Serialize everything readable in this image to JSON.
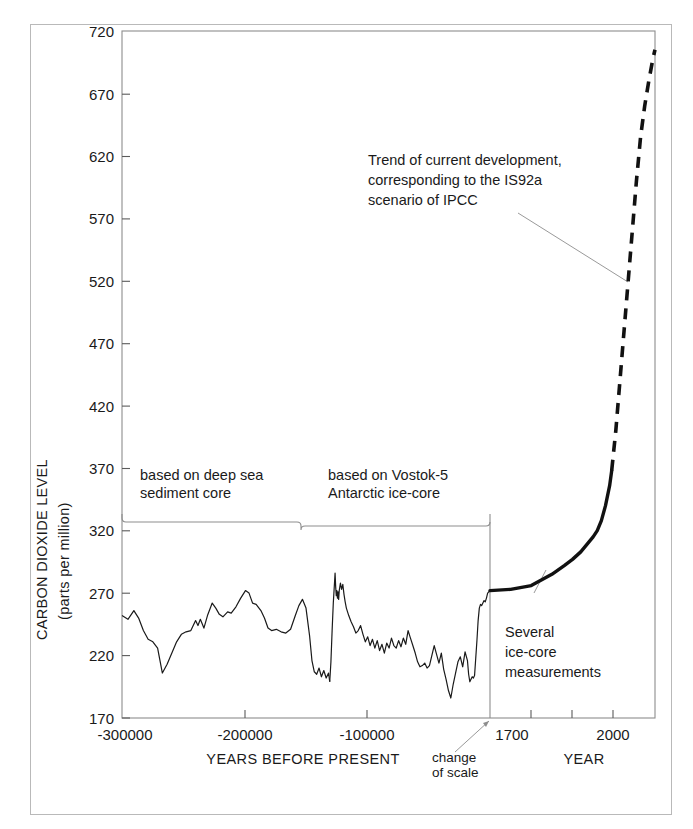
{
  "chart_data": {
    "type": "line",
    "title": "",
    "xlabel": "YEARS BEFORE PRESENT / YEAR",
    "ylabel": "CARBON DIOXIDE LEVEL (parts per million)",
    "ylim": [
      170,
      720
    ],
    "ytick_labels": [
      "170",
      "220",
      "270",
      "320",
      "370",
      "420",
      "470",
      "520",
      "570",
      "620",
      "670",
      "720"
    ],
    "yticks": [
      170,
      220,
      270,
      320,
      370,
      420,
      470,
      520,
      570,
      620,
      670,
      720
    ],
    "grid": false,
    "legend": "none",
    "axes": {
      "left": {
        "name": "YEARS BEFORE PRESENT",
        "label": "YEARS BEFORE PRESENT",
        "tick_labels": [
          "-300000",
          "-200000",
          "-100000"
        ],
        "ticks": [
          -300000,
          -200000,
          -100000
        ],
        "range": [
          -310000,
          0
        ]
      },
      "right": {
        "name": "YEAR",
        "label": "YEAR",
        "tick_labels": [
          "1700",
          "2000"
        ],
        "ticks": [
          1700,
          1800,
          1900,
          2000,
          2100
        ],
        "range": [
          1700,
          2100
        ]
      },
      "scale_break": {
        "label_line1": "change",
        "label_line2": "of scale",
        "at_year": 1700
      }
    },
    "annotations": [
      {
        "id": "deep-sea",
        "text_line1": "based on deep sea",
        "text_line2": "sediment core"
      },
      {
        "id": "vostok",
        "text_line1": "based on Vostok-5",
        "text_line2": "Antarctic ice-core"
      },
      {
        "id": "ipcc",
        "text_line1": "Trend of current development,",
        "text_line2": "corresponding to the IS92a",
        "text_line3": "scenario of IPCC"
      },
      {
        "id": "ice-core-meas",
        "text_line1": "Several",
        "text_line2": "ice-core",
        "text_line3": "measurements"
      }
    ],
    "series": [
      {
        "name": "deep sea sediment core",
        "style": "solid-thin",
        "x_units": "years before present",
        "points": [
          [
            -310000,
            252
          ],
          [
            -305000,
            249
          ],
          [
            -300000,
            256
          ],
          [
            -296000,
            250
          ],
          [
            -292000,
            240
          ],
          [
            -288000,
            233
          ],
          [
            -284000,
            231
          ],
          [
            -280000,
            226
          ],
          [
            -276000,
            206
          ],
          [
            -272000,
            213
          ],
          [
            -268000,
            222
          ],
          [
            -264000,
            231
          ],
          [
            -260000,
            237
          ],
          [
            -256000,
            239
          ],
          [
            -252000,
            240
          ],
          [
            -248000,
            248
          ],
          [
            -246000,
            244
          ],
          [
            -244000,
            249
          ],
          [
            -241000,
            242
          ],
          [
            -238000,
            252
          ],
          [
            -234000,
            262
          ],
          [
            -231000,
            258
          ],
          [
            -228000,
            253
          ],
          [
            -225000,
            251
          ],
          [
            -221000,
            255
          ],
          [
            -218000,
            254
          ],
          [
            -214000,
            259
          ],
          [
            -210000,
            266
          ],
          [
            -206000,
            272
          ],
          [
            -203000,
            270
          ],
          [
            -200000,
            262
          ],
          [
            -197000,
            261
          ],
          [
            -193000,
            256
          ],
          [
            -190000,
            250
          ],
          [
            -187000,
            242
          ],
          [
            -184000,
            240
          ],
          [
            -180000,
            241
          ],
          [
            -176000,
            239
          ],
          [
            -172000,
            238
          ],
          [
            -168000,
            241
          ],
          [
            -164000,
            252
          ],
          [
            -161000,
            260
          ],
          [
            -158000,
            265
          ],
          [
            -155000,
            258
          ],
          [
            -152000,
            236
          ],
          [
            -150000,
            216
          ],
          [
            -148000,
            207
          ],
          [
            -146000,
            205
          ],
          [
            -144000,
            210
          ],
          [
            -142000,
            203
          ],
          [
            -140000,
            208
          ],
          [
            -138000,
            202
          ],
          [
            -136000,
            206
          ],
          [
            -135000,
            199
          ]
        ]
      },
      {
        "name": "Vostok-5 Antarctic ice-core",
        "style": "solid-thin",
        "x_units": "years before present",
        "points": [
          [
            -135000,
            199
          ],
          [
            -134000,
            215
          ],
          [
            -133000,
            240
          ],
          [
            -132000,
            262
          ],
          [
            -131000,
            278
          ],
          [
            -130500,
            286
          ],
          [
            -130000,
            275
          ],
          [
            -129500,
            268
          ],
          [
            -129000,
            272
          ],
          [
            -128500,
            266
          ],
          [
            -128000,
            271
          ],
          [
            -127500,
            265
          ],
          [
            -127000,
            272
          ],
          [
            -126000,
            278
          ],
          [
            -125000,
            273
          ],
          [
            -124000,
            277
          ],
          [
            -123000,
            269
          ],
          [
            -122000,
            263
          ],
          [
            -121000,
            258
          ],
          [
            -119000,
            252
          ],
          [
            -117000,
            247
          ],
          [
            -115000,
            243
          ],
          [
            -113000,
            238
          ],
          [
            -111000,
            240
          ],
          [
            -109000,
            244
          ],
          [
            -107000,
            237
          ],
          [
            -105000,
            231
          ],
          [
            -103000,
            235
          ],
          [
            -101000,
            228
          ],
          [
            -99000,
            233
          ],
          [
            -97000,
            226
          ],
          [
            -95000,
            232
          ],
          [
            -93000,
            224
          ],
          [
            -91000,
            229
          ],
          [
            -89000,
            222
          ],
          [
            -87000,
            230
          ],
          [
            -85000,
            226
          ],
          [
            -83000,
            234
          ],
          [
            -81000,
            228
          ],
          [
            -79000,
            226
          ],
          [
            -77000,
            232
          ],
          [
            -75000,
            227
          ],
          [
            -73000,
            234
          ],
          [
            -71000,
            229
          ],
          [
            -69000,
            240
          ],
          [
            -67000,
            234
          ],
          [
            -65000,
            228
          ],
          [
            -63000,
            222
          ],
          [
            -61000,
            215
          ],
          [
            -59000,
            211
          ],
          [
            -57000,
            212
          ],
          [
            -55000,
            214
          ],
          [
            -53000,
            210
          ],
          [
            -51000,
            212
          ],
          [
            -49000,
            220
          ],
          [
            -47000,
            228
          ],
          [
            -45000,
            221
          ],
          [
            -43000,
            214
          ],
          [
            -41000,
            222
          ],
          [
            -39000,
            209
          ],
          [
            -37000,
            201
          ],
          [
            -35000,
            192
          ],
          [
            -33000,
            186
          ],
          [
            -31000,
            197
          ],
          [
            -29000,
            206
          ],
          [
            -27000,
            215
          ],
          [
            -25000,
            219
          ],
          [
            -23000,
            211
          ],
          [
            -21000,
            223
          ],
          [
            -19000,
            216
          ],
          [
            -18000,
            205
          ],
          [
            -17000,
            199
          ],
          [
            -16000,
            201
          ],
          [
            -15000,
            203
          ],
          [
            -14000,
            202
          ],
          [
            -13000,
            204
          ],
          [
            -12000,
            218
          ],
          [
            -11000,
            232
          ],
          [
            -10000,
            248
          ],
          [
            -9000,
            258
          ],
          [
            -8000,
            261
          ],
          [
            -7000,
            260
          ],
          [
            -6000,
            262
          ],
          [
            -5000,
            264
          ],
          [
            -4000,
            263
          ],
          [
            -3000,
            266
          ],
          [
            -2000,
            270
          ],
          [
            -1000,
            271
          ],
          [
            0,
            272
          ]
        ]
      },
      {
        "name": "Several ice-core measurements / instrumental record",
        "style": "solid-thick",
        "x_units": "year",
        "points": [
          [
            1700,
            272
          ],
          [
            1750,
            273
          ],
          [
            1800,
            276
          ],
          [
            1850,
            285
          ],
          [
            1880,
            292
          ],
          [
            1900,
            297
          ],
          [
            1920,
            303
          ],
          [
            1940,
            311
          ],
          [
            1950,
            315
          ],
          [
            1960,
            320
          ],
          [
            1970,
            328
          ],
          [
            1980,
            340
          ],
          [
            1990,
            356
          ],
          [
            1995,
            368
          ]
        ]
      },
      {
        "name": "IS92a scenario of IPCC",
        "style": "dashed-thick",
        "x_units": "year",
        "points": [
          [
            1995,
            368
          ],
          [
            2005,
            400
          ],
          [
            2015,
            440
          ],
          [
            2025,
            480
          ],
          [
            2035,
            520
          ],
          [
            2045,
            560
          ],
          [
            2055,
            600
          ],
          [
            2065,
            635
          ],
          [
            2075,
            660
          ],
          [
            2085,
            680
          ],
          [
            2095,
            698
          ],
          [
            2100,
            705
          ]
        ]
      }
    ]
  }
}
